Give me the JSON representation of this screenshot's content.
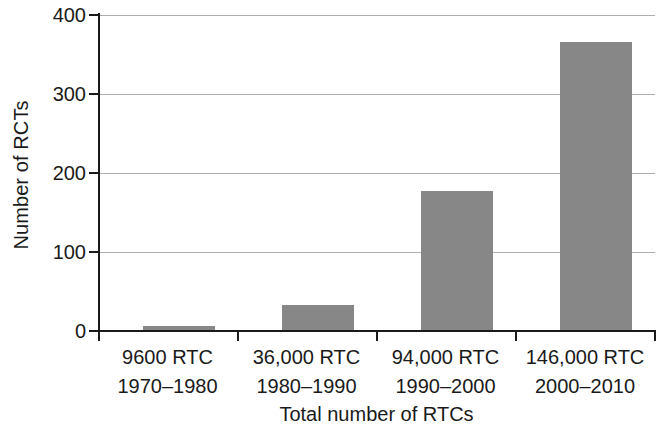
{
  "chart_data": {
    "type": "bar",
    "title": "",
    "xlabel": "Total number of RTCs",
    "ylabel": "Number of RCTs",
    "categories": [
      "9600 RTC\n1970–1980",
      "36,000 RTC\n1980–1990",
      "94,000 RTC\n1990–2000",
      "146,000 RTC\n2000–2010"
    ],
    "category_lines": [
      {
        "line1": "9600 RTC",
        "line2": "1970–1980"
      },
      {
        "line1": "36,000 RTC",
        "line2": "1980–1990"
      },
      {
        "line1": "94,000 RTC",
        "line2": "1990–2000"
      },
      {
        "line1": "146,000 RTC",
        "line2": "2000–2010"
      }
    ],
    "values": [
      6,
      33,
      177,
      366
    ],
    "ylim": [
      0,
      400
    ],
    "yticks": [
      0,
      100,
      200,
      300,
      400
    ],
    "ytick_labels": [
      "0",
      "100",
      "200",
      "300",
      "400"
    ],
    "grid": true,
    "grid_axis": "y",
    "legend": false,
    "bar_color": "#878787",
    "grid_color": "#aeaeae",
    "axis_color": "#1a1a1a",
    "background": "#ffffff"
  }
}
